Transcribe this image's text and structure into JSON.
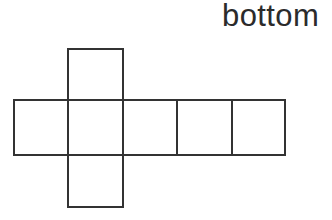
{
  "figure": {
    "kind": "cube-net-diagram",
    "background_color": "#ffffff",
    "stroke_color": "#333333",
    "stroke_width": 2,
    "fill_color": "#ffffff",
    "caption": {
      "text": "bottom",
      "color": "#2b2b2b",
      "font_size": 31
    },
    "grid": {
      "x_lines": [
        14,
        68,
        123,
        177,
        232,
        285
      ],
      "y_lines": [
        49,
        100,
        155,
        207
      ],
      "cell_width": 54,
      "cell_height": 54
    },
    "cells": [
      {
        "name": "top-flap",
        "x": 68,
        "y": 49,
        "w": 55,
        "h": 51,
        "label": ""
      },
      {
        "name": "row-square-1",
        "x": 14,
        "y": 100,
        "w": 54,
        "h": 55,
        "label": ""
      },
      {
        "name": "row-square-2",
        "x": 68,
        "y": 100,
        "w": 55,
        "h": 55,
        "label": ""
      },
      {
        "name": "row-square-3",
        "x": 123,
        "y": 100,
        "w": 54,
        "h": 55,
        "label": ""
      },
      {
        "name": "row-square-4",
        "x": 177,
        "y": 100,
        "w": 55,
        "h": 55,
        "label": ""
      },
      {
        "name": "row-square-5",
        "x": 232,
        "y": 100,
        "w": 53,
        "h": 55,
        "label": ""
      },
      {
        "name": "bottom-flap",
        "x": 68,
        "y": 155,
        "w": 55,
        "h": 52,
        "label": ""
      }
    ]
  }
}
